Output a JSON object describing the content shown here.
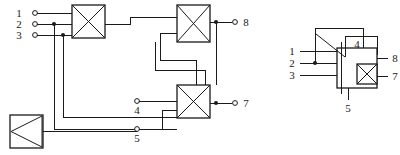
{
  "diagram": {
    "stroke_color": "#1a1a1a",
    "background_color": "#ffffff",
    "left_circuit": {
      "name": "expanded-network",
      "input_labels": [
        "1",
        "2",
        "3"
      ],
      "output_labels": [
        "8",
        "7"
      ],
      "tap_labels": [
        "4",
        "5"
      ],
      "switch_count": 3,
      "amplifier_count": 1,
      "switch_symbol": "crossed-square",
      "amplifier_symbol": "boxed-triangle-left"
    },
    "right_circuit": {
      "name": "compact-symbol",
      "input_labels": [
        "1",
        "2",
        "3"
      ],
      "output_labels": [
        "8",
        "7"
      ],
      "tap_labels": [
        "4",
        "5"
      ],
      "switch_symbol": "crossed-square",
      "has_diagonal_slash": true
    }
  },
  "labels": {
    "l_in_1": "1",
    "l_in_2": "2",
    "l_in_3": "3",
    "l_tap_4": "4",
    "l_tap_5": "5",
    "l_out_8": "8",
    "l_out_7": "7",
    "r_in_1": "1",
    "r_in_2": "2",
    "r_in_3": "3",
    "r_tap_4": "4",
    "r_tap_5": "5",
    "r_out_8": "8",
    "r_out_7": "7"
  }
}
